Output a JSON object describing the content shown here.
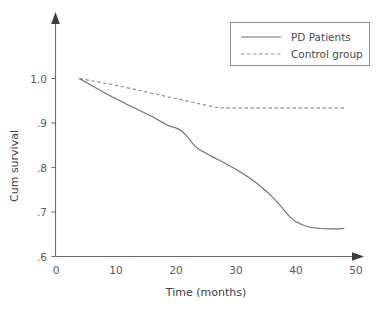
{
  "chart_data": {
    "type": "line",
    "title": "",
    "subtitle": "",
    "xlabel": "Time (months)",
    "ylabel": "Cum survival",
    "xlim": [
      0,
      50
    ],
    "ylim": [
      0.6,
      1.0
    ],
    "xticks": [
      "0",
      "10",
      "20",
      "30",
      "40",
      "50"
    ],
    "xtick_values": [
      0,
      10,
      20,
      30,
      40,
      50
    ],
    "yticks": [
      "1.0",
      ".9",
      ".8",
      ".7",
      ".6"
    ],
    "ytick_values": [
      1.0,
      0.9,
      0.8,
      0.7,
      0.6
    ],
    "grid": false,
    "legend_position": "top-right",
    "series": [
      {
        "name": "PD Patients",
        "style": "solid",
        "color": "#707070",
        "x": [
          4,
          6,
          8,
          10,
          12,
          14,
          16,
          18,
          19,
          20,
          21,
          22,
          23,
          24,
          26,
          28,
          30,
          32,
          34,
          36,
          38,
          39,
          40,
          42,
          44,
          46,
          48
        ],
        "values": [
          1.0,
          0.984,
          0.969,
          0.955,
          0.941,
          0.928,
          0.915,
          0.9,
          0.893,
          0.889,
          0.882,
          0.868,
          0.851,
          0.84,
          0.825,
          0.811,
          0.796,
          0.779,
          0.759,
          0.735,
          0.705,
          0.689,
          0.678,
          0.667,
          0.663,
          0.662,
          0.663
        ]
      },
      {
        "name": "Control group",
        "style": "dashed",
        "color": "#8c8c8c",
        "x": [
          4,
          6,
          8,
          10,
          12,
          14,
          16,
          18,
          20,
          22,
          24,
          26,
          27,
          28,
          30,
          32,
          34,
          36,
          38,
          40,
          42,
          44,
          46,
          48
        ],
        "values": [
          1.0,
          0.995,
          0.99,
          0.985,
          0.979,
          0.973,
          0.967,
          0.961,
          0.955,
          0.949,
          0.943,
          0.937,
          0.935,
          0.934,
          0.934,
          0.934,
          0.934,
          0.934,
          0.934,
          0.934,
          0.934,
          0.934,
          0.934,
          0.934
        ]
      }
    ]
  },
  "legend": {
    "entries": [
      {
        "label": "PD Patients"
      },
      {
        "label": "Control group"
      }
    ]
  },
  "axes": {
    "x_title": "Time (months)",
    "y_title": "Cum survival"
  }
}
